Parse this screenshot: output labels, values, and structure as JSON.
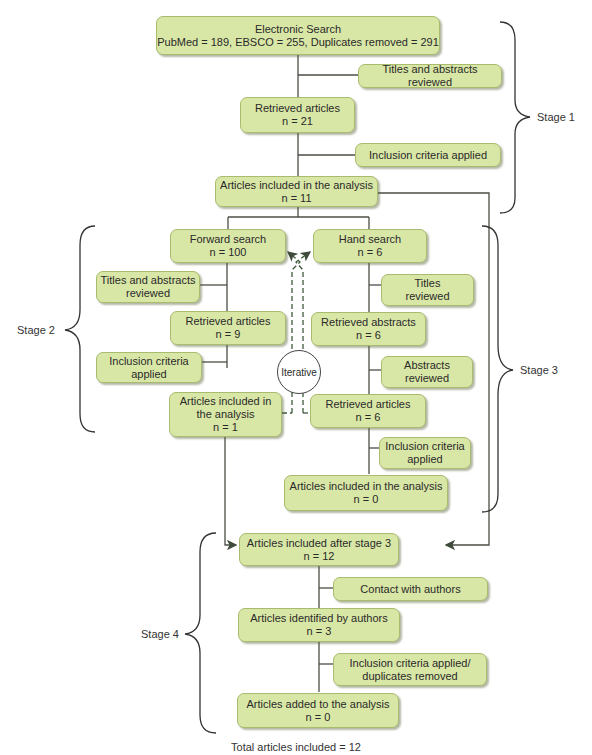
{
  "stage1": {
    "label": "Stage 1",
    "electronic_search": {
      "title": "Electronic Search",
      "detail": "PubMed = 189, EBSCO = 255, Duplicates removed = 291"
    },
    "titles_abstracts_reviewed": "Titles and abstracts reviewed",
    "retrieved_articles": {
      "title": "Retrieved articles",
      "n": "n = 21"
    },
    "inclusion_criteria": "Inclusion criteria applied",
    "included": {
      "title": "Articles included in the analysis",
      "n": "n = 11"
    }
  },
  "stage2": {
    "label": "Stage 2",
    "forward_search": {
      "title": "Forward search",
      "n": "n = 100"
    },
    "titles_abstracts_reviewed": {
      "line1": "Titles and abstracts",
      "line2": "reviewed"
    },
    "retrieved_articles": {
      "title": "Retrieved articles",
      "n": "n = 9"
    },
    "inclusion_criteria": {
      "line1": "Inclusion criteria",
      "line2": "applied"
    },
    "included": {
      "line1": "Articles included in",
      "line2": "the analysis",
      "n": "n = 1"
    }
  },
  "iterative_label": "Iterative",
  "stage3": {
    "label": "Stage 3",
    "hand_search": {
      "title": "Hand search",
      "n": "n = 6"
    },
    "titles_reviewed": {
      "line1": "Titles",
      "line2": "reviewed"
    },
    "retrieved_abstracts": {
      "title": "Retrieved abstracts",
      "n": "n = 6"
    },
    "abstracts_reviewed": {
      "line1": "Abstracts",
      "line2": "reviewed"
    },
    "retrieved_articles": {
      "title": "Retrieved articles",
      "n": "n = 6"
    },
    "inclusion_criteria": {
      "line1": "Inclusion criteria",
      "line2": "applied"
    },
    "included": {
      "title": "Articles included in the analysis",
      "n": "n = 0"
    }
  },
  "stage4": {
    "label": "Stage 4",
    "after_stage3": {
      "title": "Articles included after stage 3",
      "n": "n = 12"
    },
    "contact_authors": "Contact with authors",
    "identified_by_authors": {
      "title": "Articles identified by authors",
      "n": "n = 3"
    },
    "inclusion_duplicates": {
      "line1": "Inclusion criteria applied/",
      "line2": "duplicates removed"
    },
    "added": {
      "title": "Articles added to the analysis",
      "n": "n = 0"
    }
  },
  "total": "Total articles included = 12",
  "colors": {
    "box_fill": "#d9e7a6",
    "box_border": "#a9bb6e",
    "line": "#4a4f44",
    "dashed_arrow": "#3e5a3a"
  }
}
